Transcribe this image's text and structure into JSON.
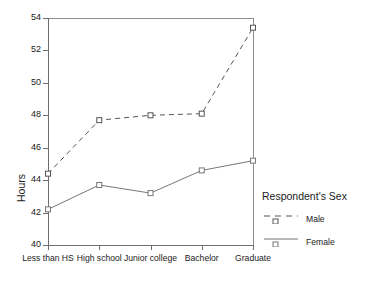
{
  "chart_data": {
    "type": "line",
    "title": "",
    "xlabel": "",
    "ylabel": "Hours",
    "ylim": [
      40,
      54
    ],
    "yticks": [
      40,
      42,
      44,
      46,
      48,
      50,
      52,
      54
    ],
    "grid": false,
    "legend_position": "right",
    "legend_title": "Respondent's Sex",
    "categories": [
      "Less than HS",
      "High school",
      "Junior college",
      "Bachelor",
      "Graduate"
    ],
    "series": [
      {
        "name": "Male",
        "style": "dashed",
        "marker": "square",
        "color": "#555555",
        "values": [
          44.4,
          47.7,
          48.0,
          48.1,
          53.4
        ]
      },
      {
        "name": "Female",
        "style": "solid",
        "marker": "square",
        "color": "#777777",
        "values": [
          42.2,
          43.7,
          43.2,
          44.6,
          45.2
        ]
      }
    ]
  },
  "axis": {
    "y_title": "Hours",
    "y_tick_labels": [
      "40",
      "42",
      "44",
      "46",
      "48",
      "50",
      "52",
      "54"
    ],
    "x_tick_labels": [
      "Less than HS",
      "High school",
      "Junior college",
      "Bachelor",
      "Graduate"
    ]
  },
  "legend": {
    "title": "Respondent's Sex",
    "entries": [
      {
        "label": "Male"
      },
      {
        "label": "Female"
      }
    ]
  }
}
